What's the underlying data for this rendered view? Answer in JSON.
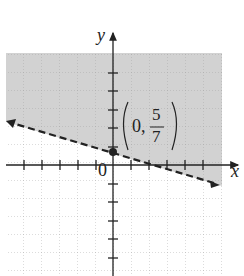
{
  "graph": {
    "x_axis_label": "x",
    "y_axis_label": "y",
    "origin_label": "0",
    "point_label": "(0, 5/7)",
    "point_x": "0",
    "point_num": "5",
    "point_den": "7",
    "boundary": "dashed",
    "shaded": "above line",
    "colors": {
      "shade": "#d2d2d2",
      "axis": "#222222",
      "grid": "#999999"
    }
  }
}
